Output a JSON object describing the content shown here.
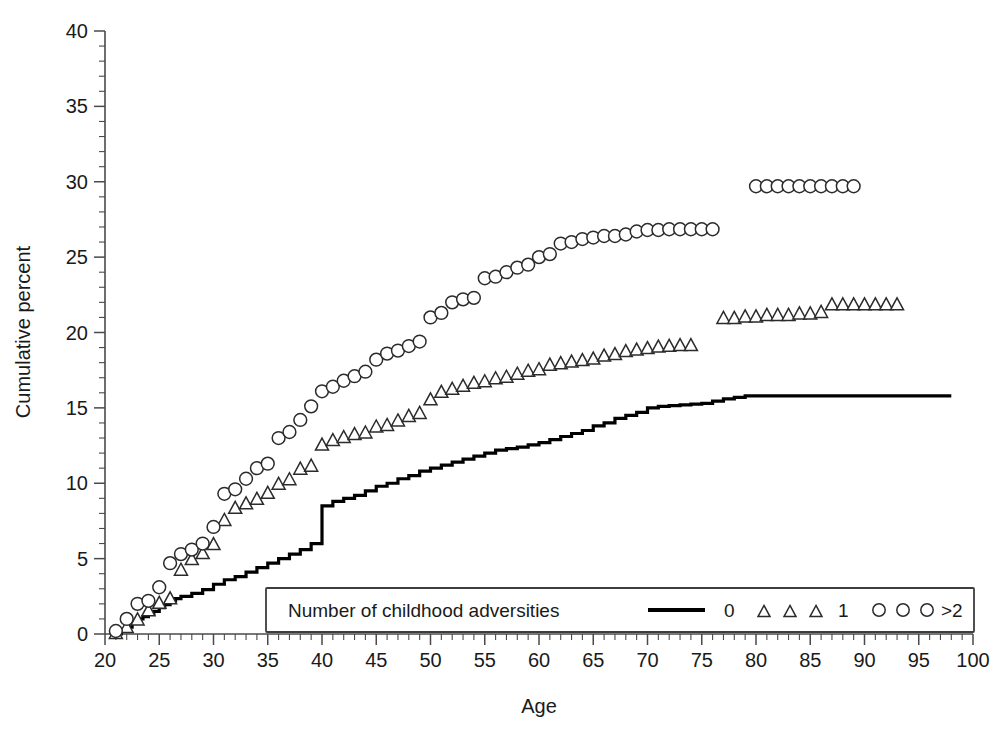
{
  "chart_data": {
    "type": "line",
    "title": "",
    "xlabel": "Age",
    "ylabel": "Cumulative percent",
    "xlim": [
      20,
      100
    ],
    "ylim": [
      0,
      40
    ],
    "xticks": [
      20,
      25,
      30,
      35,
      40,
      45,
      50,
      55,
      60,
      65,
      70,
      75,
      80,
      85,
      90,
      95,
      100
    ],
    "yticks": [
      0,
      5,
      10,
      15,
      20,
      25,
      30,
      35,
      40
    ],
    "x_minor_step": 1,
    "y_minor_step": 1,
    "grid": false,
    "legend_position": "bottom-center-inside",
    "legend_title": "Number of childhood adversities",
    "series": [
      {
        "name": "0",
        "marker": "solid-line",
        "style": "step",
        "points": [
          [
            21,
            0.0
          ],
          [
            21.5,
            0.25
          ],
          [
            22,
            0.45
          ],
          [
            22.5,
            0.7
          ],
          [
            23,
            1.0
          ],
          [
            23.5,
            1.15
          ],
          [
            24,
            1.3
          ],
          [
            24.5,
            1.5
          ],
          [
            25,
            1.75
          ],
          [
            25.5,
            1.95
          ],
          [
            26,
            2.2
          ],
          [
            26.5,
            2.35
          ],
          [
            27,
            2.5
          ],
          [
            28,
            2.7
          ],
          [
            29,
            2.95
          ],
          [
            30,
            3.3
          ],
          [
            31,
            3.6
          ],
          [
            32,
            3.8
          ],
          [
            33,
            4.1
          ],
          [
            34,
            4.4
          ],
          [
            35,
            4.7
          ],
          [
            36,
            5.0
          ],
          [
            37,
            5.3
          ],
          [
            38,
            5.6
          ],
          [
            39,
            6.0
          ],
          [
            40,
            8.5
          ],
          [
            41,
            8.8
          ],
          [
            42,
            9.0
          ],
          [
            43,
            9.2
          ],
          [
            44,
            9.5
          ],
          [
            45,
            9.8
          ],
          [
            46,
            10.0
          ],
          [
            47,
            10.3
          ],
          [
            48,
            10.5
          ],
          [
            49,
            10.8
          ],
          [
            50,
            11.0
          ],
          [
            51,
            11.2
          ],
          [
            52,
            11.4
          ],
          [
            53,
            11.6
          ],
          [
            54,
            11.8
          ],
          [
            55,
            12.0
          ],
          [
            56,
            12.2
          ],
          [
            57,
            12.3
          ],
          [
            58,
            12.4
          ],
          [
            59,
            12.55
          ],
          [
            60,
            12.7
          ],
          [
            61,
            12.9
          ],
          [
            62,
            13.1
          ],
          [
            63,
            13.3
          ],
          [
            64,
            13.5
          ],
          [
            65,
            13.8
          ],
          [
            66,
            14.0
          ],
          [
            67,
            14.3
          ],
          [
            68,
            14.5
          ],
          [
            69,
            14.7
          ],
          [
            70,
            15.0
          ],
          [
            71,
            15.1
          ],
          [
            72,
            15.15
          ],
          [
            73,
            15.2
          ],
          [
            74,
            15.25
          ],
          [
            75,
            15.3
          ],
          [
            76,
            15.45
          ],
          [
            77,
            15.6
          ],
          [
            78,
            15.7
          ],
          [
            79,
            15.8
          ],
          [
            98,
            15.8
          ]
        ]
      },
      {
        "name": "1",
        "marker": "triangle",
        "style": "markers",
        "points": [
          [
            21,
            0.1
          ],
          [
            22,
            0.5
          ],
          [
            23,
            1.0
          ],
          [
            24,
            1.6
          ],
          [
            25,
            2.1
          ],
          [
            26,
            2.4
          ],
          [
            27,
            4.3
          ],
          [
            28,
            5.0
          ],
          [
            29,
            5.4
          ],
          [
            30,
            6.0
          ],
          [
            31,
            7.6
          ],
          [
            32,
            8.4
          ],
          [
            33,
            8.7
          ],
          [
            34,
            9.0
          ],
          [
            35,
            9.4
          ],
          [
            36,
            10.0
          ],
          [
            37,
            10.3
          ],
          [
            38,
            11.0
          ],
          [
            39,
            11.2
          ],
          [
            40,
            12.6
          ],
          [
            41,
            12.9
          ],
          [
            42,
            13.1
          ],
          [
            43,
            13.3
          ],
          [
            44,
            13.4
          ],
          [
            45,
            13.8
          ],
          [
            46,
            13.9
          ],
          [
            47,
            14.2
          ],
          [
            48,
            14.5
          ],
          [
            49,
            14.7
          ],
          [
            50,
            15.6
          ],
          [
            51,
            16.1
          ],
          [
            52,
            16.3
          ],
          [
            53,
            16.5
          ],
          [
            54,
            16.7
          ],
          [
            55,
            16.8
          ],
          [
            56,
            17.0
          ],
          [
            57,
            17.1
          ],
          [
            58,
            17.3
          ],
          [
            59,
            17.5
          ],
          [
            60,
            17.6
          ],
          [
            61,
            17.9
          ],
          [
            62,
            18.0
          ],
          [
            63,
            18.1
          ],
          [
            64,
            18.2
          ],
          [
            65,
            18.3
          ],
          [
            66,
            18.5
          ],
          [
            67,
            18.6
          ],
          [
            68,
            18.8
          ],
          [
            69,
            18.9
          ],
          [
            70,
            19.0
          ],
          [
            71,
            19.1
          ],
          [
            72,
            19.15
          ],
          [
            73,
            19.2
          ],
          [
            74,
            19.2
          ],
          [
            77,
            21.0
          ],
          [
            78,
            21.0
          ],
          [
            79,
            21.1
          ],
          [
            80,
            21.1
          ],
          [
            81,
            21.2
          ],
          [
            82,
            21.2
          ],
          [
            83,
            21.2
          ],
          [
            84,
            21.3
          ],
          [
            85,
            21.3
          ],
          [
            86,
            21.4
          ],
          [
            87,
            21.9
          ],
          [
            88,
            21.9
          ],
          [
            89,
            21.9
          ],
          [
            90,
            21.9
          ],
          [
            91,
            21.9
          ],
          [
            92,
            21.9
          ],
          [
            93,
            21.9
          ]
        ]
      },
      {
        "name": ">2",
        "marker": "circle",
        "style": "markers",
        "points": [
          [
            21,
            0.2
          ],
          [
            22,
            1.0
          ],
          [
            23,
            2.0
          ],
          [
            24,
            2.2
          ],
          [
            25,
            3.1
          ],
          [
            26,
            4.7
          ],
          [
            27,
            5.3
          ],
          [
            28,
            5.6
          ],
          [
            29,
            6.0
          ],
          [
            30,
            7.1
          ],
          [
            31,
            9.3
          ],
          [
            32,
            9.6
          ],
          [
            33,
            10.3
          ],
          [
            34,
            11.0
          ],
          [
            35,
            11.3
          ],
          [
            36,
            13.0
          ],
          [
            37,
            13.4
          ],
          [
            38,
            14.2
          ],
          [
            39,
            15.1
          ],
          [
            40,
            16.1
          ],
          [
            41,
            16.4
          ],
          [
            42,
            16.8
          ],
          [
            43,
            17.1
          ],
          [
            44,
            17.4
          ],
          [
            45,
            18.2
          ],
          [
            46,
            18.6
          ],
          [
            47,
            18.8
          ],
          [
            48,
            19.1
          ],
          [
            49,
            19.4
          ],
          [
            50,
            21.0
          ],
          [
            51,
            21.3
          ],
          [
            52,
            22.0
          ],
          [
            53,
            22.2
          ],
          [
            54,
            22.3
          ],
          [
            55,
            23.6
          ],
          [
            56,
            23.7
          ],
          [
            57,
            24.0
          ],
          [
            58,
            24.3
          ],
          [
            59,
            24.5
          ],
          [
            60,
            25.0
          ],
          [
            61,
            25.2
          ],
          [
            62,
            25.9
          ],
          [
            63,
            26.0
          ],
          [
            64,
            26.2
          ],
          [
            65,
            26.3
          ],
          [
            66,
            26.4
          ],
          [
            67,
            26.4
          ],
          [
            68,
            26.5
          ],
          [
            69,
            26.7
          ],
          [
            70,
            26.8
          ],
          [
            71,
            26.8
          ],
          [
            72,
            26.85
          ],
          [
            73,
            26.85
          ],
          [
            74,
            26.85
          ],
          [
            75,
            26.85
          ],
          [
            76,
            26.85
          ],
          [
            80,
            29.7
          ],
          [
            81,
            29.7
          ],
          [
            82,
            29.7
          ],
          [
            83,
            29.7
          ],
          [
            84,
            29.7
          ],
          [
            85,
            29.7
          ],
          [
            86,
            29.7
          ],
          [
            87,
            29.7
          ],
          [
            88,
            29.7
          ],
          [
            89,
            29.7
          ]
        ]
      }
    ]
  },
  "legend": {
    "title": "Number of childhood adversities",
    "entries": [
      {
        "label": "0",
        "symbol": "solid-line"
      },
      {
        "label": "1",
        "symbol": "triangle"
      },
      {
        "label": ">2",
        "symbol": "circle"
      }
    ]
  },
  "axes": {
    "x_title": "Age",
    "y_title": "Cumulative percent"
  },
  "colors": {
    "line": "#000000",
    "marker_stroke": "#2b2b2b",
    "marker_fill": "#ffffff",
    "axis": "#4a4a4a",
    "background": "#ffffff"
  }
}
